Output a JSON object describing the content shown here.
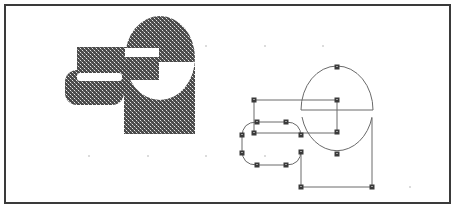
{
  "figure": {
    "frame": {
      "x": 5,
      "y": 5,
      "w": 445,
      "h": 198,
      "stroke": "#3a3a3a",
      "stroke_width": 2
    },
    "colors": {
      "pattern_dark": "#4a4a4a",
      "pattern_light": "#e8e8e8",
      "outline": "#6a6a6a",
      "handle_fill": "#3a3a3a",
      "handle_center": "#9a9a9a",
      "grid_dot": "#dcdcdc",
      "background": "#ffffff"
    },
    "grid_dots": [
      [
        89,
        156
      ],
      [
        148,
        156
      ],
      [
        206,
        156
      ],
      [
        206,
        46
      ],
      [
        265,
        46
      ],
      [
        323,
        46
      ],
      [
        265,
        156
      ],
      [
        410,
        187
      ]
    ],
    "left_composite": {
      "description": "Filled result of combining shapes (pattern-filled)",
      "rounded_rect": {
        "x": 65,
        "y": 70,
        "w": 59,
        "h": 35,
        "r": 12
      },
      "rect": {
        "x": 77,
        "y": 47,
        "w": 83,
        "h": 33
      },
      "white_bar_1": {
        "x": 77,
        "y": 73,
        "w": 45,
        "h": 8
      },
      "white_bar_2": {
        "x": 125,
        "y": 48,
        "w": 34,
        "h": 9
      },
      "big_rect": {
        "x": 124,
        "y": 62,
        "w": 71,
        "h": 72
      },
      "ellipse": {
        "cx": 160,
        "cy": 58,
        "rx": 35,
        "ry": 42
      },
      "split_y": 62
    },
    "right_outline": {
      "description": "Outline view with selection handles",
      "ellipse": {
        "cx": 337,
        "cy": 111,
        "rx": 36,
        "ry": 44
      },
      "split_line": {
        "x1": 301,
        "y1": 110,
        "x2": 373,
        "y2": 110
      },
      "rect": {
        "x1": 254,
        "y1": 100,
        "x2": 337,
        "y2": 133
      },
      "rounded_rect": {
        "x1": 242,
        "y1": 122,
        "x2": 301,
        "y2": 165,
        "r": 15
      },
      "bottom_path": [
        [
          301,
          152
        ],
        [
          301,
          187
        ],
        [
          372,
          187
        ],
        [
          372,
          118
        ]
      ],
      "handles": [
        [
          337,
          67
        ],
        [
          254,
          100
        ],
        [
          337,
          100
        ],
        [
          254,
          133
        ],
        [
          337,
          132
        ],
        [
          257,
          122
        ],
        [
          286,
          122
        ],
        [
          242,
          135
        ],
        [
          242,
          153
        ],
        [
          257,
          165
        ],
        [
          286,
          165
        ],
        [
          301,
          135
        ],
        [
          301,
          152
        ],
        [
          337,
          154
        ],
        [
          301,
          187
        ],
        [
          372,
          187
        ]
      ]
    }
  }
}
